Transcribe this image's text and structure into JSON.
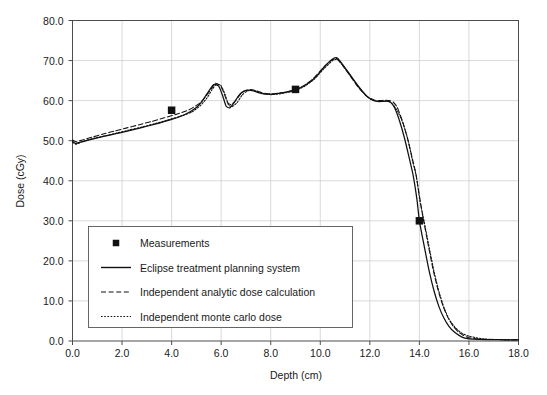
{
  "chart_data": {
    "type": "line",
    "title": "",
    "xlabel": "Depth (cm)",
    "ylabel": "Dose (cGy)",
    "xlim": [
      0.0,
      18.0
    ],
    "ylim": [
      0.0,
      80.0
    ],
    "xticks": [
      "0.0",
      "2.0",
      "4.0",
      "6.0",
      "8.0",
      "10.0",
      "12.0",
      "14.0",
      "16.0",
      "18.0"
    ],
    "yticks": [
      "0.0",
      "10.0",
      "20.0",
      "30.0",
      "40.0",
      "50.0",
      "60.0",
      "70.0",
      "80.0"
    ],
    "xtick_values": [
      0.0,
      2.0,
      4.0,
      6.0,
      8.0,
      10.0,
      12.0,
      14.0,
      16.0,
      18.0
    ],
    "ytick_values": [
      0.0,
      10.0,
      20.0,
      30.0,
      40.0,
      50.0,
      60.0,
      70.0,
      80.0
    ],
    "grid": true,
    "legend_position": "lower-left-inside",
    "series": [
      {
        "name": "Measurements",
        "style": "scatter",
        "marker": "square",
        "color": "#111111",
        "points": [
          {
            "x": 4.0,
            "y": 57.6
          },
          {
            "x": 9.0,
            "y": 62.8
          },
          {
            "x": 14.0,
            "y": 30.0
          }
        ]
      },
      {
        "name": "Eclipse treatment planning system",
        "style": "solid",
        "color": "#111111",
        "x": [
          0.0,
          0.12,
          0.3,
          0.6,
          1.0,
          1.5,
          2.0,
          2.5,
          3.0,
          3.5,
          4.0,
          4.5,
          5.0,
          5.25,
          5.5,
          5.7,
          5.9,
          6.05,
          6.2,
          6.35,
          6.5,
          6.7,
          6.9,
          7.1,
          7.3,
          7.5,
          7.7,
          7.9,
          8.1,
          8.3,
          8.6,
          9.0,
          9.4,
          9.8,
          10.2,
          10.5,
          10.7,
          11.0,
          11.3,
          11.6,
          11.9,
          12.1,
          12.3,
          12.5,
          12.7,
          12.85,
          13.0,
          13.2,
          13.4,
          13.6,
          13.75,
          13.9,
          14.0,
          14.2,
          14.4,
          14.6,
          14.8,
          15.0,
          15.2,
          15.4,
          15.6,
          15.8,
          16.0,
          16.4,
          17.0,
          17.5,
          18.0
        ],
        "y": [
          49.9,
          49.3,
          49.6,
          50.1,
          50.7,
          51.4,
          52.1,
          52.8,
          53.6,
          54.4,
          55.3,
          56.4,
          58.3,
          60.0,
          62.4,
          64.0,
          63.6,
          61.4,
          58.6,
          58.2,
          59.3,
          61.2,
          62.3,
          62.6,
          62.4,
          62.0,
          61.7,
          61.6,
          61.6,
          61.8,
          62.1,
          62.7,
          63.9,
          65.8,
          68.7,
          70.4,
          70.6,
          68.2,
          65.6,
          63.1,
          61.0,
          60.2,
          59.8,
          59.8,
          59.9,
          59.5,
          58.2,
          54.9,
          50.6,
          45.4,
          41.3,
          35.4,
          30.0,
          23.5,
          17.3,
          12.3,
          8.4,
          5.6,
          3.6,
          2.3,
          1.4,
          0.8,
          0.55,
          0.4,
          0.35,
          0.3,
          0.3
        ]
      },
      {
        "name": "Independent analytic dose calculation",
        "style": "dashed",
        "color": "#111111",
        "x": [
          0.0,
          0.15,
          0.4,
          0.8,
          1.2,
          1.7,
          2.2,
          2.7,
          3.2,
          3.7,
          4.2,
          4.7,
          5.1,
          5.35,
          5.6,
          5.75,
          5.95,
          6.1,
          6.25,
          6.4,
          6.6,
          6.8,
          7.0,
          7.2,
          7.4,
          7.6,
          7.8,
          8.0,
          8.2,
          8.5,
          8.9,
          9.3,
          9.7,
          10.1,
          10.45,
          10.65,
          10.9,
          11.2,
          11.5,
          11.8,
          12.0,
          12.2,
          12.4,
          12.6,
          12.8,
          12.95,
          13.1,
          13.3,
          13.5,
          13.7,
          13.85,
          14.0,
          14.15,
          14.35,
          14.55,
          14.75,
          14.95,
          15.15,
          15.35,
          15.55,
          15.75,
          16.0,
          16.5,
          17.2,
          18.0
        ],
        "y": [
          50.2,
          49.7,
          50.2,
          50.9,
          51.6,
          52.4,
          53.2,
          54.0,
          54.8,
          55.7,
          56.6,
          57.7,
          59.2,
          60.8,
          62.9,
          64.3,
          63.9,
          62.1,
          59.6,
          59.0,
          60.1,
          61.8,
          62.6,
          62.8,
          62.5,
          62.1,
          61.8,
          61.7,
          61.8,
          62.0,
          62.6,
          63.6,
          65.4,
          68.1,
          70.1,
          70.5,
          68.8,
          66.2,
          63.6,
          61.5,
          60.6,
          60.1,
          60.0,
          60.1,
          60.0,
          59.6,
          58.4,
          55.2,
          51.0,
          46.0,
          42.0,
          36.3,
          30.7,
          24.2,
          17.9,
          12.8,
          8.8,
          5.9,
          3.8,
          2.4,
          1.5,
          0.8,
          0.45,
          0.35,
          0.3
        ]
      },
      {
        "name": "Independent monte carlo dose",
        "style": "dotted",
        "color": "#111111",
        "x": [
          0.0,
          0.15,
          0.4,
          0.8,
          1.3,
          1.8,
          2.3,
          2.8,
          3.3,
          3.8,
          4.3,
          4.8,
          5.15,
          5.4,
          5.62,
          5.8,
          6.0,
          6.15,
          6.3,
          6.45,
          6.65,
          6.85,
          7.05,
          7.25,
          7.45,
          7.65,
          7.85,
          8.05,
          8.25,
          8.55,
          8.95,
          9.35,
          9.75,
          10.15,
          10.5,
          10.7,
          10.95,
          11.25,
          11.55,
          11.85,
          12.05,
          12.25,
          12.45,
          12.65,
          12.82,
          13.0,
          13.15,
          13.35,
          13.55,
          13.72,
          13.88,
          14.02,
          14.2,
          14.4,
          14.6,
          14.8,
          15.0,
          15.2,
          15.45,
          15.7,
          16.0,
          16.6,
          17.3,
          18.0
        ],
        "y": [
          49.6,
          49.1,
          49.8,
          50.5,
          51.2,
          51.9,
          52.7,
          53.4,
          54.2,
          55.1,
          56.0,
          57.1,
          58.7,
          60.4,
          62.6,
          64.1,
          63.7,
          61.7,
          58.9,
          58.5,
          59.6,
          61.4,
          62.4,
          62.6,
          62.3,
          61.9,
          61.6,
          61.5,
          61.6,
          61.9,
          62.4,
          63.5,
          65.3,
          68.0,
          70.0,
          70.3,
          68.5,
          65.9,
          63.3,
          61.2,
          60.3,
          59.9,
          59.8,
          59.9,
          59.7,
          58.5,
          57.0,
          54.2,
          50.0,
          45.0,
          41.0,
          35.0,
          29.6,
          23.2,
          17.1,
          12.1,
          8.2,
          5.4,
          3.3,
          2.0,
          1.2,
          0.5,
          0.35,
          0.3
        ]
      }
    ]
  },
  "legend": {
    "items": [
      {
        "label": "Measurements",
        "style": "marker"
      },
      {
        "label": "Eclipse treatment planning system",
        "style": "solid"
      },
      {
        "label": "Independent analytic dose calculation",
        "style": "dashed"
      },
      {
        "label": "Independent monte carlo dose",
        "style": "dotted"
      }
    ]
  },
  "colors": {
    "curve": "#111111",
    "grid": "#c8c8c8",
    "frame": "#4d4d4d",
    "text": "#1a1a1a",
    "background": "#ffffff"
  }
}
